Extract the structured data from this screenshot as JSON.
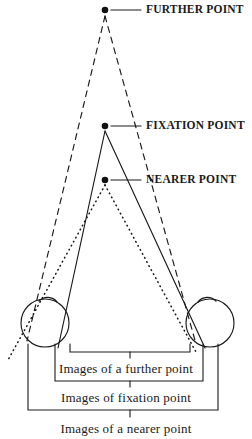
{
  "figure": {
    "type": "optics-stereopsis-diagram",
    "stroke_color": "#1a1a1a",
    "background": "#ffffff"
  },
  "points": [
    {
      "id": "further",
      "label": "FURTHER POINT",
      "x": 105,
      "y": 10,
      "line_style": "dashed",
      "label_x": 143,
      "label_y": 3
    },
    {
      "id": "fixation",
      "label": "FIXATION POINT",
      "x": 105,
      "y": 126,
      "line_style": "solid",
      "label_x": 143,
      "label_y": 119
    },
    {
      "id": "nearer",
      "label": "NEARER POINT",
      "x": 105,
      "y": 180,
      "line_style": "dotted",
      "label_x": 143,
      "label_y": 173
    }
  ],
  "eyes": [
    {
      "id": "left-eye",
      "cx": 45,
      "cy": 323,
      "r": 24
    },
    {
      "id": "right-eye",
      "cx": 210,
      "cy": 323,
      "r": 24
    }
  ],
  "brackets": [
    {
      "id": "further-images",
      "label": "Images of a further point",
      "left": 70,
      "right": 190,
      "top": 352,
      "label_y": 362
    },
    {
      "id": "fixation-images",
      "label": "Images of fixation point",
      "left": 55,
      "right": 203,
      "top": 381,
      "label_y": 391
    },
    {
      "id": "nearer-images",
      "label": "Images of a nearer point",
      "left": 28,
      "right": 218,
      "top": 410,
      "label_y": 422
    }
  ]
}
